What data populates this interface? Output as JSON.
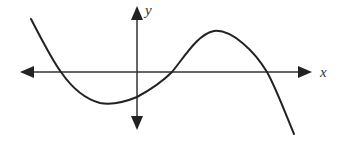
{
  "figure": {
    "type": "function-graph",
    "axes": {
      "x_label": "x",
      "y_label": "y",
      "x_axis": {
        "y_px": 72,
        "x_start_px": 20,
        "x_end_px": 312,
        "arrows": "both"
      },
      "y_axis": {
        "x_px": 137,
        "y_start_px": 6,
        "y_end_px": 130,
        "arrows": "both"
      }
    },
    "curve": {
      "color": "#222222",
      "stroke_width": 2,
      "key_points_px": [
        {
          "name": "start",
          "x": 31,
          "y": 19
        },
        {
          "name": "x-intercept-1",
          "x": 61,
          "y": 72
        },
        {
          "name": "local-minimum",
          "x": 107,
          "y": 103
        },
        {
          "name": "y-intercept",
          "x": 137,
          "y": 97
        },
        {
          "name": "x-intercept-2",
          "x": 172,
          "y": 72
        },
        {
          "name": "local-maximum",
          "x": 214,
          "y": 31
        },
        {
          "name": "x-intercept-3",
          "x": 267,
          "y": 72
        },
        {
          "name": "end",
          "x": 294,
          "y": 134
        }
      ],
      "path": "M31,19 C42,40 52,60 61,72 C72,88 85,99 100,103 C112,105 125,102 137,97 C150,90 162,82 172,72 C185,56 198,34 214,31 C232,29 255,52 267,72 C276,88 286,115 294,134"
    },
    "colors": {
      "axis": "#333333",
      "curve": "#222222",
      "background": "#ffffff"
    }
  }
}
